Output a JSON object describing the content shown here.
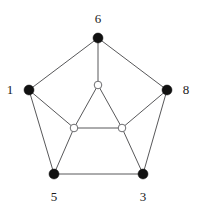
{
  "figure": {
    "width": 202,
    "height": 214,
    "background_color": "#ffffff"
  },
  "style": {
    "edge_color": "#58585a",
    "edge_width": 1,
    "filled_node_color": "#111111",
    "filled_node_radius": 5,
    "hollow_node_fill": "#ffffff",
    "hollow_node_stroke": "#6d6d70",
    "hollow_node_radius": 3.8,
    "label_color": "#1a1a1a",
    "label_font_size": 13
  },
  "chart_data": {
    "type": "diagram",
    "title": "",
    "nodes": [
      {
        "id": "n6",
        "label": "6",
        "x": 98,
        "y": 38,
        "style": "filled",
        "label_x": 98,
        "label_y": 18,
        "label_position": "above"
      },
      {
        "id": "n1",
        "label": "1",
        "x": 29,
        "y": 90,
        "style": "filled",
        "label_x": 10,
        "label_y": 89,
        "label_position": "left"
      },
      {
        "id": "n8",
        "label": "8",
        "x": 167,
        "y": 90,
        "style": "filled",
        "label_x": 186,
        "label_y": 89,
        "label_position": "right"
      },
      {
        "id": "n5",
        "label": "5",
        "x": 54,
        "y": 174,
        "style": "filled",
        "label_x": 54,
        "label_y": 196,
        "label_position": "below"
      },
      {
        "id": "n3",
        "label": "3",
        "x": 143,
        "y": 174,
        "style": "filled",
        "label_x": 143,
        "label_y": 196,
        "label_position": "below"
      },
      {
        "id": "i_top",
        "label": "",
        "x": 98,
        "y": 85,
        "style": "hollow",
        "label_x": null,
        "label_y": null,
        "label_position": "none"
      },
      {
        "id": "i_left",
        "label": "",
        "x": 74,
        "y": 128,
        "style": "hollow",
        "label_x": null,
        "label_y": null,
        "label_position": "none"
      },
      {
        "id": "i_right",
        "label": "",
        "x": 122,
        "y": 128,
        "style": "hollow",
        "label_x": null,
        "label_y": null,
        "label_position": "none"
      }
    ],
    "edges": [
      {
        "from": "n6",
        "to": "n1",
        "x1": 98,
        "y1": 38,
        "x2": 29,
        "y2": 90
      },
      {
        "from": "n6",
        "to": "n8",
        "x1": 98,
        "y1": 38,
        "x2": 167,
        "y2": 90
      },
      {
        "from": "n6",
        "to": "i_top",
        "x1": 98,
        "y1": 38,
        "x2": 98,
        "y2": 85
      },
      {
        "from": "n1",
        "to": "n5",
        "x1": 29,
        "y1": 90,
        "x2": 54,
        "y2": 174
      },
      {
        "from": "n1",
        "to": "i_left",
        "x1": 29,
        "y1": 90,
        "x2": 74,
        "y2": 128
      },
      {
        "from": "n8",
        "to": "n3",
        "x1": 167,
        "y1": 90,
        "x2": 143,
        "y2": 174
      },
      {
        "from": "n8",
        "to": "i_right",
        "x1": 167,
        "y1": 90,
        "x2": 122,
        "y2": 128
      },
      {
        "from": "n5",
        "to": "n3",
        "x1": 54,
        "y1": 174,
        "x2": 143,
        "y2": 174
      },
      {
        "from": "n5",
        "to": "i_left",
        "x1": 54,
        "y1": 174,
        "x2": 74,
        "y2": 128
      },
      {
        "from": "n3",
        "to": "i_right",
        "x1": 143,
        "y1": 174,
        "x2": 122,
        "y2": 128
      },
      {
        "from": "i_top",
        "to": "i_left",
        "x1": 98,
        "y1": 85,
        "x2": 74,
        "y2": 128
      },
      {
        "from": "i_top",
        "to": "i_right",
        "x1": 98,
        "y1": 85,
        "x2": 122,
        "y2": 128
      },
      {
        "from": "i_left",
        "to": "i_right",
        "x1": 74,
        "y1": 128,
        "x2": 122,
        "y2": 128
      }
    ],
    "labels": [
      "6",
      "1",
      "8",
      "5",
      "3"
    ]
  }
}
